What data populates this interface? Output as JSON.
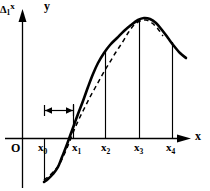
{
  "figure": {
    "title": "",
    "axes": {
      "y_axis_label": "y",
      "x_axis_label": "x",
      "origin_label": "O"
    },
    "tick_labels": [
      {
        "key": "x0",
        "text": "x",
        "sub": "0"
      },
      {
        "key": "x1",
        "text": "x",
        "sub": "1"
      },
      {
        "key": "x2",
        "text": "x",
        "sub": "2"
      },
      {
        "key": "x3",
        "text": "x",
        "sub": "3"
      },
      {
        "key": "x4",
        "text": "x",
        "sub": "4"
      }
    ],
    "annotation": {
      "delta_symbol": "Δ",
      "delta_subscript": "1",
      "delta_variable": "x"
    }
  },
  "chart_data": {
    "type": "line",
    "title": "",
    "xlabel": "x",
    "ylabel": "y",
    "grid": false,
    "legend": "none",
    "xlim": [
      0,
      210
    ],
    "ylim": [
      0,
      191
    ],
    "x_axis_y_pixel": 138,
    "y_axis_x_pixel": 22,
    "categories": [
      "x0",
      "x1",
      "x2",
      "x3",
      "x4"
    ],
    "tick_x_pixels": [
      44,
      73,
      105,
      139,
      172
    ],
    "tick_text": [
      "x₀",
      "x₁",
      "x₂",
      "x₃",
      "x₄"
    ],
    "annotations": [
      {
        "text": "Δ1x",
        "type": "dimension-bracket",
        "from": "x0",
        "to": "x1",
        "x_from_pixel": 44,
        "x_to_pixel": 73,
        "y_pixel": 110
      }
    ],
    "series": [
      {
        "name": "solid-curve",
        "style": "solid",
        "width": 2.6,
        "color": "#000000",
        "points": [
          [
            44,
            182
          ],
          [
            48,
            179
          ],
          [
            53,
            174
          ],
          [
            58,
            167
          ],
          [
            62,
            157
          ],
          [
            66,
            147
          ],
          [
            70,
            136
          ],
          [
            74,
            125
          ],
          [
            78,
            114
          ],
          [
            83,
            101
          ],
          [
            88,
            87
          ],
          [
            93,
            74
          ],
          [
            98,
            63
          ],
          [
            104,
            53
          ],
          [
            110,
            45
          ],
          [
            117,
            38
          ],
          [
            124,
            31
          ],
          [
            131,
            25
          ],
          [
            138,
            20
          ],
          [
            144,
            18
          ],
          [
            150,
            19
          ],
          [
            156,
            23
          ],
          [
            162,
            30
          ],
          [
            168,
            38
          ],
          [
            174,
            46
          ],
          [
            180,
            53
          ],
          [
            186,
            58
          ]
        ]
      },
      {
        "name": "dashed-curve",
        "style": "dashed",
        "width": 1.5,
        "color": "#000000",
        "points": [
          [
            44,
            180
          ],
          [
            49,
            176
          ],
          [
            54,
            171
          ],
          [
            59,
            165
          ],
          [
            63,
            157
          ],
          [
            67,
            148
          ],
          [
            71,
            138
          ],
          [
            75,
            128
          ],
          [
            80,
            117
          ],
          [
            85,
            107
          ],
          [
            90,
            97
          ],
          [
            95,
            88
          ],
          [
            100,
            79
          ],
          [
            105,
            70
          ],
          [
            110,
            62
          ],
          [
            116,
            52
          ],
          [
            122,
            43
          ],
          [
            128,
            33
          ],
          [
            134,
            25
          ],
          [
            140,
            21
          ],
          [
            146,
            20
          ],
          [
            152,
            23
          ],
          [
            158,
            29
          ],
          [
            163,
            36
          ]
        ]
      }
    ],
    "ordinate_lines": [
      {
        "key": "x0",
        "x_pixel": 44,
        "y_top": 138,
        "y_bottom": 182
      },
      {
        "key": "x1",
        "x_pixel": 73,
        "y_top": 110,
        "y_bottom": 138
      },
      {
        "key": "x2",
        "x_pixel": 105,
        "y_top": 52,
        "y_bottom": 138
      },
      {
        "key": "x3",
        "x_pixel": 139,
        "y_top": 19,
        "y_bottom": 138
      },
      {
        "key": "x4",
        "x_pixel": 172,
        "y_top": 42,
        "y_bottom": 138
      }
    ]
  }
}
